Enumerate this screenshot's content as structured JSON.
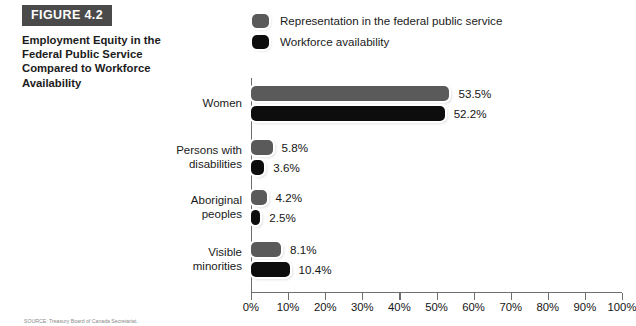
{
  "figure": {
    "badge": "FIGURE 4.2",
    "title": "Employment Equity in the Federal Public Service Compared to Workforce Availability"
  },
  "source_note": "SOURCE: Treasury Board of Canada Secretariat.",
  "colors": {
    "series_representation": "#5a5a5a",
    "series_workforce": "#0d0d0d",
    "badge_background": "#4a4a4a",
    "axis": "#6e6e6e",
    "background": "#ffffff"
  },
  "chart_data": {
    "type": "bar",
    "orientation": "horizontal",
    "title": "Employment Equity in the Federal Public Service Compared to Workforce Availability",
    "xlabel": "",
    "ylabel": "",
    "xlim": [
      0,
      100
    ],
    "grid": false,
    "legend_position": "top",
    "tick_labels": [
      "0%",
      "10%",
      "20%",
      "30%",
      "40%",
      "50%",
      "60%",
      "70%",
      "80%",
      "90%",
      "100%"
    ],
    "tick_values": [
      0,
      10,
      20,
      30,
      40,
      50,
      60,
      70,
      80,
      90,
      100
    ],
    "categories": [
      "Women",
      "Persons with disabilities",
      "Aboriginal peoples",
      "Visible minorities"
    ],
    "category_lines": [
      [
        "Women"
      ],
      [
        "Persons with",
        "disabilities"
      ],
      [
        "Aboriginal",
        "peoples"
      ],
      [
        "Visible",
        "minorities"
      ]
    ],
    "series": [
      {
        "name": "Representation in the federal public service",
        "color": "#5a5a5a",
        "values": [
          53.5,
          5.8,
          4.2,
          8.1
        ],
        "labels": [
          "53.5%",
          "5.8%",
          "4.2%",
          "8.1%"
        ]
      },
      {
        "name": "Workforce availability",
        "color": "#0d0d0d",
        "values": [
          52.2,
          3.6,
          2.5,
          10.4
        ],
        "labels": [
          "52.2%",
          "3.6%",
          "2.5%",
          "10.4%"
        ]
      }
    ]
  }
}
